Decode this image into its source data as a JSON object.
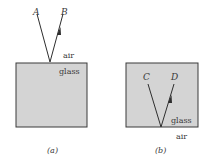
{
  "figures": [
    {
      "id": "a",
      "caption": "(a)",
      "rays": [
        {
          "label": "A",
          "role": "incident"
        },
        {
          "label": "B",
          "role": "reflected",
          "arrow": true
        }
      ],
      "media": {
        "above": "air",
        "below": "glass"
      }
    },
    {
      "id": "b",
      "caption": "(b)",
      "rays": [
        {
          "label": "C",
          "role": "incident"
        },
        {
          "label": "D",
          "role": "reflected",
          "arrow": true
        }
      ],
      "media": {
        "inside": "glass",
        "below": "air"
      }
    }
  ],
  "colors": {
    "glass_fill": "#d4d4d4",
    "outline": "#3a3a3a",
    "ray": "#2e2e2e"
  }
}
